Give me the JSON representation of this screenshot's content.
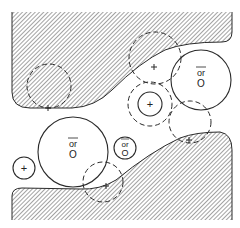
{
  "diagram": {
    "colors": {
      "background": "#ffffff",
      "line": "#2a2a2a",
      "hatch": "#555555"
    },
    "walls": [
      {
        "id": "top-wall",
        "pattern": "diagonal-hatch"
      },
      {
        "id": "bottom-wall",
        "pattern": "diagonal-hatch"
      }
    ],
    "particles": [
      {
        "id": "large-left",
        "style": "solid",
        "cx": 73,
        "cy": 152,
        "r": 35,
        "label_top": "or",
        "label_bottom": "O",
        "overbar": true
      },
      {
        "id": "large-right",
        "style": "solid",
        "cx": 201,
        "cy": 80,
        "r": 30,
        "label_top": "or",
        "label_bottom": "O",
        "overbar": true
      },
      {
        "id": "small-center",
        "style": "solid",
        "cx": 125,
        "cy": 148,
        "r": 11,
        "label_top": "or",
        "label_bottom": "O",
        "overbar": true
      },
      {
        "id": "small-plus-center",
        "style": "solid",
        "cx": 150,
        "cy": 104,
        "r": 12,
        "label": "+"
      },
      {
        "id": "small-plus-left",
        "style": "solid",
        "cx": 24,
        "cy": 168,
        "r": 11,
        "label": "+"
      }
    ],
    "dashed_circles": [
      {
        "id": "halo-center",
        "cx": 150,
        "cy": 104,
        "r": 22
      },
      {
        "id": "halo-top-left",
        "cx": 49,
        "cy": 86,
        "r": 22
      },
      {
        "id": "halo-bottom",
        "cx": 103,
        "cy": 182,
        "r": 20
      },
      {
        "id": "halo-top-right",
        "cx": 155,
        "cy": 58,
        "r": 26
      },
      {
        "id": "halo-right-lower",
        "cx": 190,
        "cy": 122,
        "r": 21
      }
    ],
    "plus_marks": [
      {
        "x": 48,
        "y": 108
      },
      {
        "x": 154,
        "y": 67
      },
      {
        "x": 106,
        "y": 186
      },
      {
        "x": 189,
        "y": 143
      }
    ],
    "labels": {
      "or": "or",
      "O": "O",
      "plus": "+"
    }
  }
}
